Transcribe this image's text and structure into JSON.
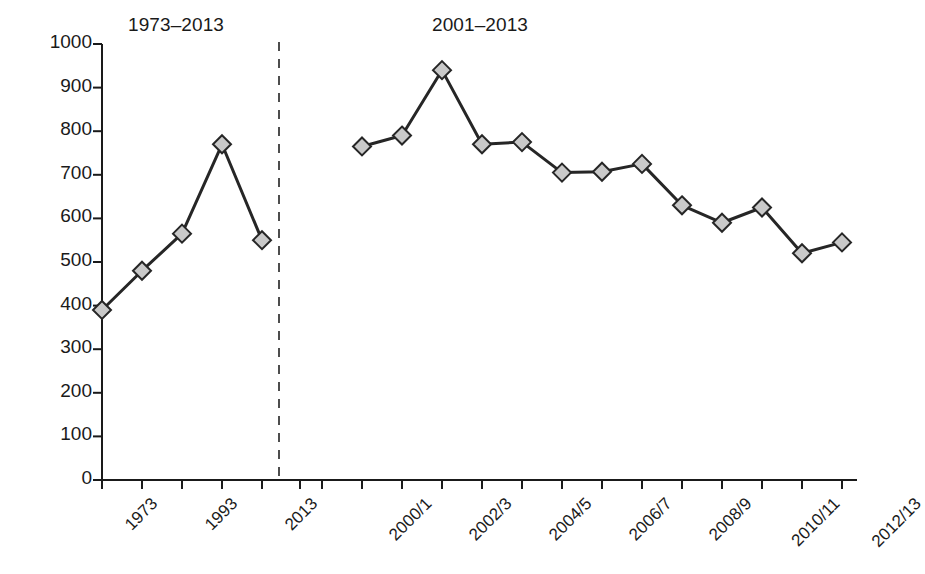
{
  "chart_data": {
    "type": "line",
    "title": "",
    "xlabel": "",
    "ylabel": "",
    "ylim": [
      0,
      1000
    ],
    "ytick_step": 100,
    "yticks": [
      "0",
      "100",
      "200",
      "300",
      "400",
      "500",
      "600",
      "700",
      "800",
      "900",
      "1000"
    ],
    "grid": false,
    "legend": "none",
    "divider": {
      "style": "dashed",
      "label": ""
    },
    "panels": [
      {
        "name": "panel-left",
        "title": "1973–2013",
        "categories": [
          "1973",
          "1983",
          "1993",
          "2003",
          "2013"
        ],
        "tick_labels": [
          "1973",
          "",
          "1993",
          "",
          "2013"
        ],
        "values": [
          390,
          480,
          565,
          770,
          550
        ]
      },
      {
        "name": "panel-right",
        "title": "2001–2013",
        "categories": [
          "2000/1",
          "2001/2",
          "2002/3",
          "2003/4",
          "2004/5",
          "2005/6",
          "2006/7",
          "2007/8",
          "2008/9",
          "2009/10",
          "2010/11",
          "2011/12",
          "2012/13"
        ],
        "tick_labels": [
          "2000/1",
          "",
          "2002/3",
          "",
          "2004/5",
          "",
          "2006/7",
          "",
          "2008/9",
          "",
          "2010/11",
          "",
          "2012/13"
        ],
        "values": [
          765,
          790,
          940,
          770,
          775,
          705,
          707,
          725,
          630,
          590,
          625,
          520,
          545
        ]
      }
    ],
    "colors": {
      "line": "#262626",
      "marker_fill": "#c9c9c9",
      "marker_stroke": "#262626",
      "axis": "#1a1a1a",
      "background": "#ffffff"
    },
    "marker": "diamond"
  }
}
